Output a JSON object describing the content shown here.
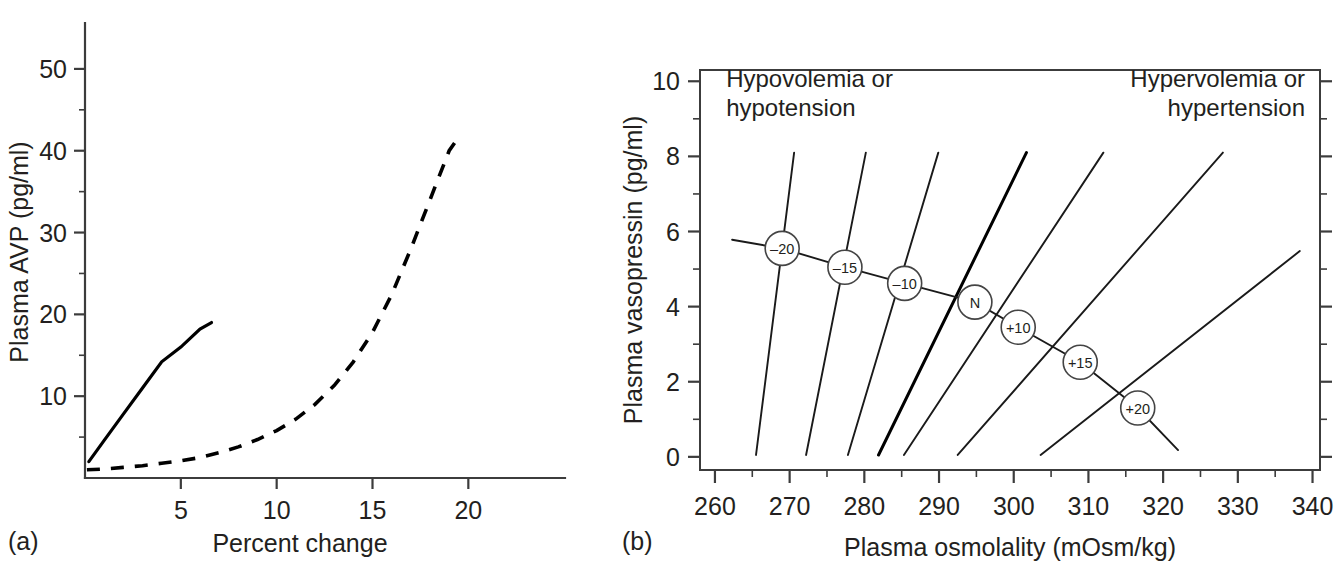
{
  "figure": {
    "panel_a_label": "(a)",
    "panel_b_label": "(b)"
  },
  "chart_data": [
    {
      "id": "panel-a",
      "type": "line",
      "title": "",
      "xlabel": "Percent change",
      "ylabel": "Plasma AVP (pg/ml)",
      "xlim": [
        0,
        24
      ],
      "ylim": [
        0,
        55
      ],
      "xticks": [
        5,
        10,
        15,
        20
      ],
      "xtick_labels": [
        "5",
        "10",
        "15",
        "20"
      ],
      "xminor_ticks": [],
      "yticks": [
        10,
        20,
        30,
        40,
        50
      ],
      "ytick_labels": [
        "10",
        "20",
        "30",
        "40",
        "50"
      ],
      "yminor_ticks": [
        5,
        15,
        25,
        35,
        45
      ],
      "grid": false,
      "legend": "none",
      "series": [
        {
          "name": "Blood volume or pressure response",
          "style": "solid",
          "x": [
            0.2,
            1.0,
            2.0,
            3.0,
            4.0,
            5.0,
            6.0,
            6.6
          ],
          "y": [
            2.0,
            4.6,
            7.8,
            11.0,
            14.2,
            16.0,
            18.2,
            19.0
          ]
        },
        {
          "name": "Plasma osmolality response",
          "style": "dashed",
          "x": [
            0.1,
            1.0,
            2.0,
            3.0,
            4.0,
            5.0,
            6.0,
            7.0,
            8.0,
            9.0,
            10.0,
            11.0,
            12.0,
            13.0,
            14.0,
            15.0,
            16.0,
            17.0,
            18.0,
            19.0,
            19.6
          ],
          "y": [
            1.0,
            1.1,
            1.3,
            1.5,
            1.8,
            2.1,
            2.5,
            3.1,
            3.8,
            4.7,
            5.8,
            7.2,
            9.0,
            11.3,
            14.2,
            17.8,
            22.4,
            28.0,
            34.0,
            40.0,
            42.0
          ]
        }
      ]
    },
    {
      "id": "panel-b",
      "type": "line",
      "title": "",
      "xlabel": "Plasma osmolality (mOsm/kg)",
      "ylabel": "Plasma vasopressin (pg/ml)",
      "xlim": [
        258,
        341
      ],
      "ylim": [
        -0.35,
        10.3
      ],
      "xticks": [
        260,
        270,
        280,
        290,
        300,
        310,
        320,
        330,
        340
      ],
      "xtick_labels": [
        "260",
        "270",
        "280",
        "290",
        "300",
        "310",
        "320",
        "330",
        "340"
      ],
      "xminor_ticks": [
        265,
        275,
        285,
        295,
        305,
        315,
        325,
        335
      ],
      "yticks": [
        0,
        2,
        4,
        6,
        8,
        10
      ],
      "ytick_labels": [
        "0",
        "2",
        "4",
        "6",
        "8",
        "10"
      ],
      "yminor_ticks": [
        1,
        3,
        5,
        7,
        9
      ],
      "grid": false,
      "legend": "none",
      "annotations": [
        {
          "name": "top-left-annotation",
          "text_line1": "Hypovolemia or",
          "text_line2": "hypotension",
          "x": 261.5,
          "y": 10.0,
          "align": "start"
        },
        {
          "name": "top-right-annotation",
          "text_line1": "Hypervolemia or",
          "text_line2": "hypertension",
          "x": 339.0,
          "y": 10.0,
          "align": "end"
        }
      ],
      "isopleths": [
        {
          "label": "–20",
          "bold": false,
          "x1": 265.5,
          "y1": 0.05,
          "x2": 270.6,
          "y2": 8.1,
          "node_x": 269.0,
          "node_y": 5.55
        },
        {
          "label": "–15",
          "bold": false,
          "x1": 272.2,
          "y1": 0.05,
          "x2": 280.2,
          "y2": 8.1,
          "node_x": 277.4,
          "node_y": 5.05
        },
        {
          "label": "–10",
          "bold": false,
          "x1": 277.8,
          "y1": 0.05,
          "x2": 289.9,
          "y2": 8.1,
          "node_x": 285.4,
          "node_y": 4.62
        },
        {
          "label": "N",
          "bold": true,
          "x1": 281.9,
          "y1": 0.05,
          "x2": 301.7,
          "y2": 8.1,
          "node_x": 294.8,
          "node_y": 4.12
        },
        {
          "label": "+10",
          "bold": false,
          "x1": 285.3,
          "y1": 0.05,
          "x2": 312.0,
          "y2": 8.1,
          "node_x": 300.6,
          "node_y": 3.45
        },
        {
          "label": "+15",
          "bold": false,
          "x1": 292.5,
          "y1": 0.05,
          "x2": 328.0,
          "y2": 8.1,
          "node_x": 308.9,
          "node_y": 2.52
        },
        {
          "label": "+20",
          "bold": false,
          "x1": 303.6,
          "y1": 0.05,
          "x2": 338.3,
          "y2": 5.48,
          "node_x": 316.6,
          "node_y": 1.3
        }
      ],
      "connector": {
        "name": "normal-response-connector",
        "x": [
          262.3,
          269.0,
          277.4,
          285.4,
          294.8,
          300.6,
          308.9,
          316.6,
          322.0
        ],
        "y": [
          5.78,
          5.55,
          5.05,
          4.62,
          4.12,
          3.45,
          2.52,
          1.3,
          0.18
        ]
      }
    }
  ]
}
